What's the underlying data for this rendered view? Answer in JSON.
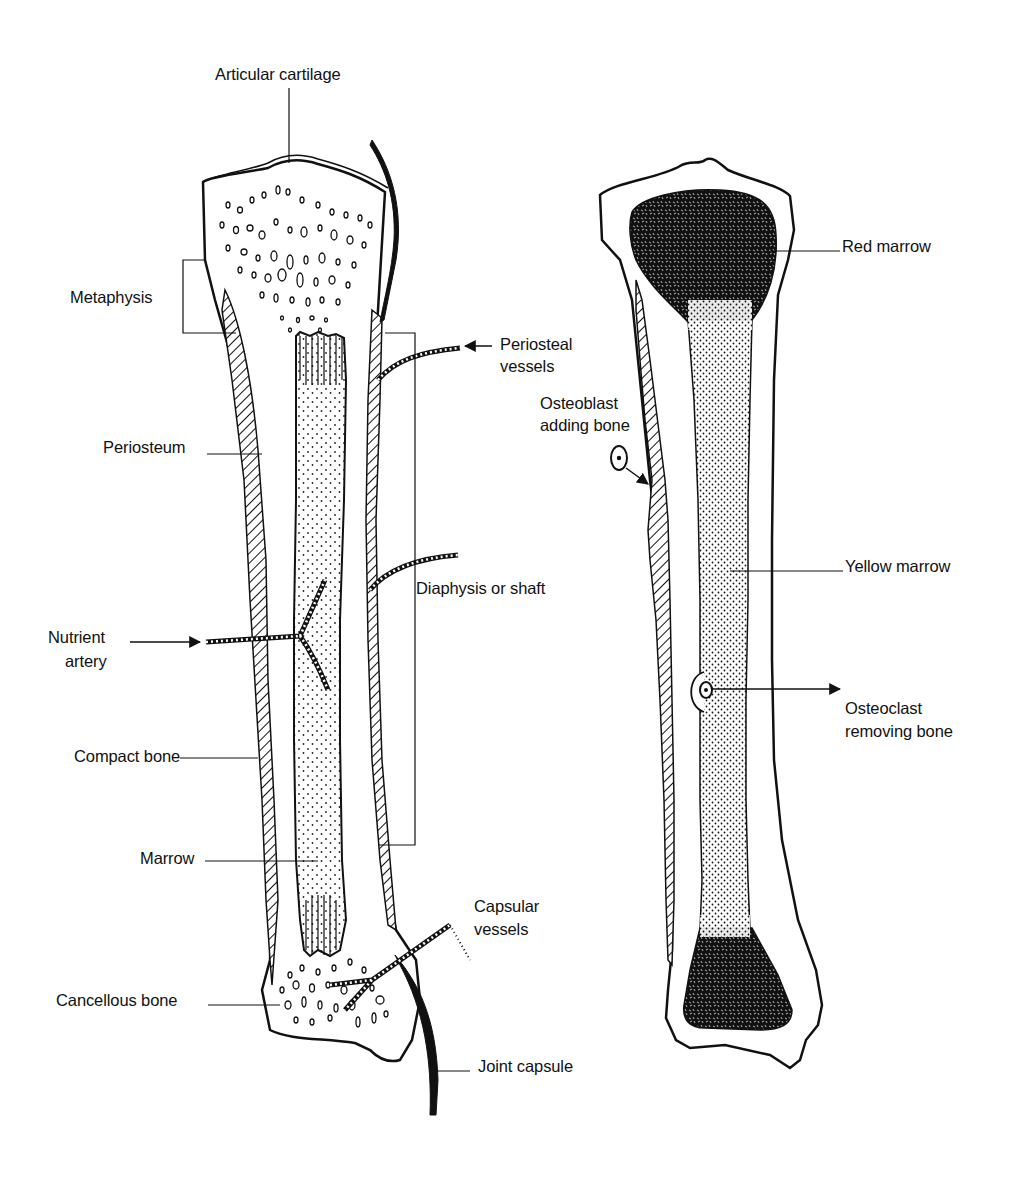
{
  "figure": {
    "colors": {
      "ink": "#111111",
      "background": "#ffffff"
    }
  },
  "left_bone": {
    "labels": {
      "articular_cartilage": "Articular cartilage",
      "metaphysis": "Metaphysis",
      "periosteal_vessels_line1": "Periosteal",
      "periosteal_vessels_line2": "vessels",
      "periosteum": "Periosteum",
      "diaphysis": "Diaphysis or shaft",
      "nutrient_artery_line1": "Nutrient",
      "nutrient_artery_line2": "artery",
      "compact_bone": "Compact bone",
      "marrow": "Marrow",
      "capsular_vessels_line1": "Capsular",
      "capsular_vessels_line2": "vessels",
      "cancellous_bone": "Cancellous bone",
      "joint_capsule": "Joint capsule"
    }
  },
  "right_bone": {
    "labels": {
      "red_marrow": "Red marrow",
      "osteoblast_line1": "Osteoblast",
      "osteoblast_line2": "adding bone",
      "yellow_marrow": "Yellow marrow",
      "osteoclast_line1": "Osteoclast",
      "osteoclast_line2": "removing bone"
    }
  }
}
